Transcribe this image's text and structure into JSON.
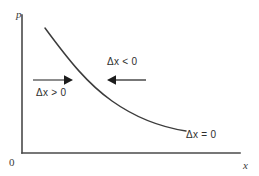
{
  "figure": {
    "background_color": "#ffffff",
    "axis_color": "#4a4a4a",
    "curve_color": "#3c3c3c",
    "arrow_color": "#1c1c1c",
    "text_color": "#2e2e2e"
  },
  "axes": {
    "y_label": "p",
    "x_label": "x",
    "origin_label": "0",
    "y_axis": {
      "x": 22,
      "y_top": 15,
      "y_bottom": 153
    },
    "x_axis": {
      "y": 153,
      "x_left": 22,
      "x_right": 240
    }
  },
  "curve": {
    "name": "demand-curve",
    "shape": "convex decreasing",
    "start_point": {
      "x": 45,
      "y": 28
    },
    "end_point": {
      "x": 186,
      "y": 131
    },
    "path": "M 45 28 C 70 62, 88 84, 112 101 C 136 118, 160 127, 186 131"
  },
  "arrows": [
    {
      "name": "arrow-right",
      "direction": "right",
      "x_start": 33,
      "x_end": 72,
      "y": 80
    },
    {
      "name": "arrow-left",
      "direction": "left",
      "x_start": 146,
      "x_end": 107,
      "y": 80
    }
  ],
  "annotations": {
    "delta_x_positive": "Δx > 0",
    "delta_x_negative": "Δx < 0",
    "delta_x_zero": "Δx = 0"
  }
}
